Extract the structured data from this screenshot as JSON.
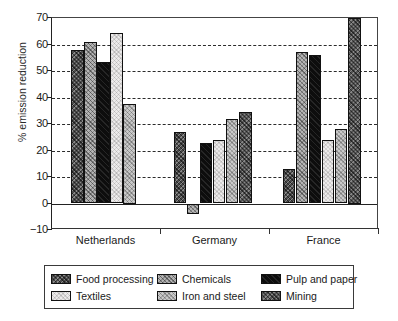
{
  "chart_data": {
    "type": "bar",
    "title": "",
    "subtitle": "",
    "xlabel": "",
    "ylabel": "% emission reduction",
    "ylim": [
      -10,
      70
    ],
    "ytick_values": [
      70,
      60,
      50,
      40,
      30,
      20,
      10,
      0,
      -10
    ],
    "ytick_labels": [
      "70",
      "60",
      "50",
      "40",
      "30",
      "20",
      "10",
      "0",
      "−10"
    ],
    "grid": true,
    "grid_axis": "y",
    "legend_position": "bottom",
    "categories": [
      "Netherlands",
      "Germany",
      "France"
    ],
    "series": [
      {
        "name": "Food processing",
        "pattern": "dark-crosshatch",
        "color": "#4a4a4a",
        "values": [
          58,
          27,
          13
        ]
      },
      {
        "name": "Chemicals",
        "pattern": "light-dotted",
        "color": "#b4b4b4",
        "values": [
          61,
          -4,
          57
        ]
      },
      {
        "name": "Pulp and paper",
        "pattern": "solid-black",
        "color": "#0d0d0d",
        "values": [
          53.5,
          23,
          56
        ]
      },
      {
        "name": "Textiles",
        "pattern": "very-light",
        "color": "#eceaea",
        "values": [
          64.5,
          24,
          24
        ]
      },
      {
        "name": "Iron and steel",
        "pattern": "mid-gray-dotted",
        "color": "#c9c9c9",
        "values": [
          37.5,
          32,
          28
        ]
      },
      {
        "name": "Mining",
        "pattern": "dark-crosshatch",
        "color": "#555555",
        "values": [
          null,
          34.5,
          70
        ]
      }
    ]
  },
  "legend": {
    "entries": [
      {
        "label": "Food processing",
        "swatch": "pat-food"
      },
      {
        "label": "Textiles",
        "swatch": "pat-textiles"
      },
      {
        "label": "Chemicals",
        "swatch": "pat-chem"
      },
      {
        "label": "Iron and steel",
        "swatch": "pat-iron"
      },
      {
        "label": "Pulp and paper",
        "swatch": "pat-pulp"
      },
      {
        "label": "Mining",
        "swatch": "pat-mining"
      }
    ]
  }
}
